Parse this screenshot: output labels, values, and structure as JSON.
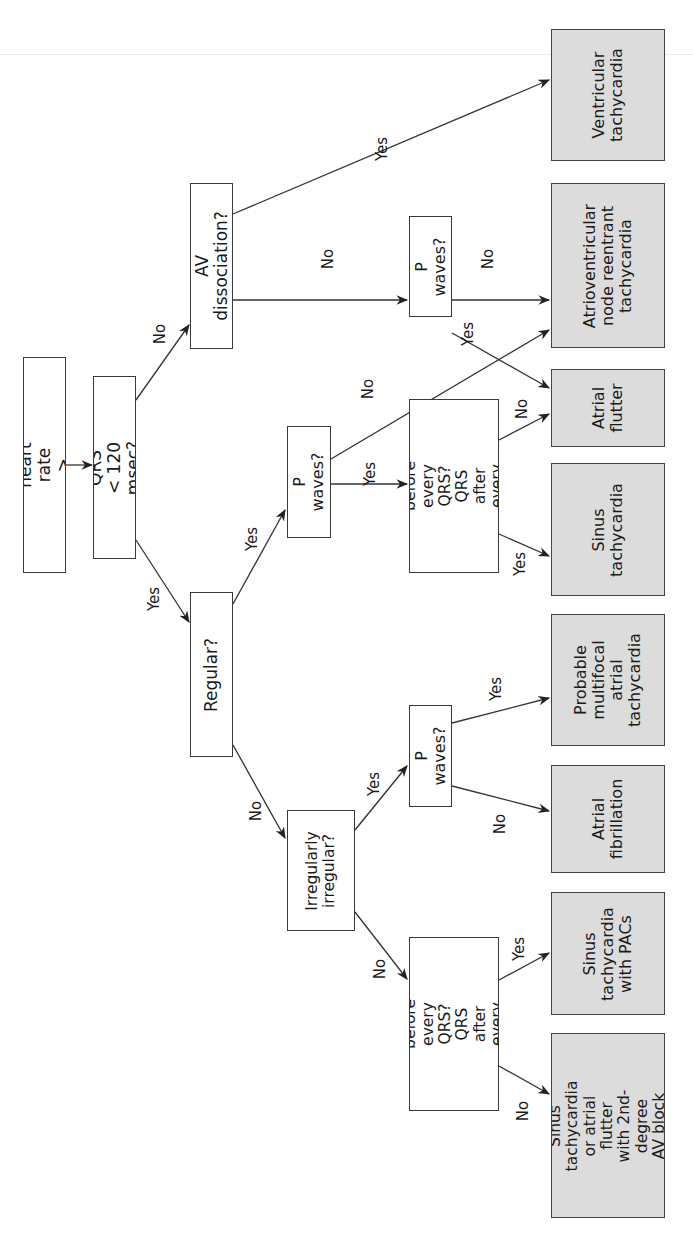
{
  "orientation": "rotated 90 degrees counter-clockwise",
  "colors": {
    "decision_fill": "#ffffff",
    "outcome_fill": "#dcdcdc",
    "line": "#333333"
  },
  "nodes": {
    "start": "For heart rate > 100",
    "qrs": "QRS < 120 msec?",
    "av_dissociation": "AV dissociation?",
    "regular": "Regular?",
    "p_waves_upper": "P waves?",
    "p_waves_mid": "P waves?",
    "p_before_upper": "P before every\nQRS? QRS after\nevery P?",
    "irregularly": "Irregularly\nirregular?",
    "p_waves_lower": "P waves?",
    "p_before_lower": "P before every\nQRS? QRS after\nevery P?"
  },
  "outcomes": {
    "vt": "Ventricular\ntachycardia",
    "avnrt": "Atrioventricular\nnode reentrant\ntachycardia",
    "atrial_flutter": "Atrial\nflutter",
    "sinus_tachy": "Sinus\ntachycardia",
    "mat": "Probable\nmultifocal\natrial\ntachycardia",
    "afib": "Atrial\nfibrillation",
    "sinus_pacs": "Sinus\ntachycardia\nwith PACs",
    "sinus_block": "Sinus tachycardia\nor atrial flutter\nwith 2nd-degree\nAV block"
  },
  "edge_labels": {
    "qrs_no": "No",
    "qrs_yes": "Yes",
    "av_yes": "Yes",
    "av_no": "No",
    "pwu_no": "No",
    "pwu_yes": "Yes",
    "reg_yes": "Yes",
    "reg_no": "No",
    "pwm_no": "No",
    "pwm_yes": "Yes",
    "pbu_no": "No",
    "pbu_yes": "Yes",
    "irr_yes": "Yes",
    "irr_no": "No",
    "pwl_yes": "Yes",
    "pwl_no": "No",
    "pbl_yes": "Yes",
    "pbl_no": "No"
  }
}
